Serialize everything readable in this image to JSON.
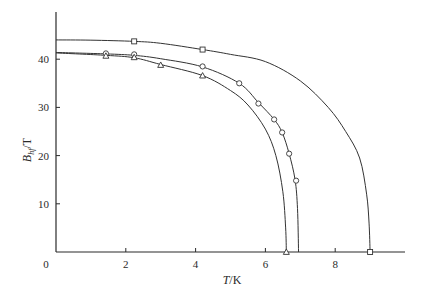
{
  "chart_data": {
    "type": "line",
    "title": "",
    "xlabel": "T/K",
    "ylabel": "B_hf/T",
    "ylabel_main": "B",
    "ylabel_sub": "hf",
    "ylabel_unit": "/T",
    "xlabel_main": "T",
    "xlabel_unit": "/K",
    "xlim": [
      0,
      10
    ],
    "ylim": [
      0,
      48
    ],
    "xticks": [
      0,
      2,
      4,
      6,
      8
    ],
    "xtick_labels": [
      "0",
      "2",
      "4",
      "6",
      "8"
    ],
    "yticks": [
      10,
      20,
      30,
      40
    ],
    "ytick_labels": [
      "10",
      "20",
      "30",
      "40"
    ],
    "grid": false,
    "legend": null,
    "series": [
      {
        "name": "square",
        "marker": "square",
        "curve": [
          [
            0,
            44.0
          ],
          [
            1,
            43.95
          ],
          [
            2.24,
            43.7
          ],
          [
            3,
            43.3
          ],
          [
            4.2,
            42.0
          ],
          [
            5,
            41.0
          ],
          [
            6,
            39.5
          ],
          [
            7,
            35.5
          ],
          [
            7.8,
            30.0
          ],
          [
            8.3,
            25.0
          ],
          [
            8.7,
            19.5
          ],
          [
            8.9,
            12.0
          ],
          [
            8.97,
            6.0
          ],
          [
            9.0,
            0
          ]
        ],
        "points": [
          [
            2.24,
            43.7
          ],
          [
            4.2,
            42.0
          ],
          [
            9.0,
            0
          ]
        ]
      },
      {
        "name": "circle",
        "marker": "circle",
        "curve": [
          [
            0,
            41.4
          ],
          [
            1.43,
            41.1
          ],
          [
            2.24,
            40.8
          ],
          [
            3,
            40.1
          ],
          [
            4.2,
            38.4
          ],
          [
            5.25,
            35.0
          ],
          [
            5.8,
            31.0
          ],
          [
            6.25,
            27.5
          ],
          [
            6.48,
            24.8
          ],
          [
            6.68,
            20.4
          ],
          [
            6.85,
            15.0
          ],
          [
            6.92,
            9.0
          ],
          [
            6.95,
            0
          ]
        ],
        "points": [
          [
            1.43,
            41.2
          ],
          [
            2.24,
            41.0
          ],
          [
            4.2,
            38.5
          ],
          [
            5.25,
            35.0
          ],
          [
            5.8,
            30.8
          ],
          [
            6.25,
            27.5
          ],
          [
            6.48,
            24.8
          ],
          [
            6.68,
            20.4
          ],
          [
            6.88,
            14.8
          ]
        ]
      },
      {
        "name": "triangle",
        "marker": "triangle",
        "curve": [
          [
            0,
            41.3
          ],
          [
            1.43,
            40.8
          ],
          [
            2.24,
            40.3
          ],
          [
            3,
            38.9
          ],
          [
            4.2,
            36.6
          ],
          [
            5,
            33.5
          ],
          [
            5.5,
            30.5
          ],
          [
            6,
            25.5
          ],
          [
            6.3,
            20.0
          ],
          [
            6.5,
            12.5
          ],
          [
            6.58,
            5.0
          ],
          [
            6.6,
            0
          ]
        ],
        "points": [
          [
            1.43,
            40.7
          ],
          [
            2.24,
            40.4
          ],
          [
            3.0,
            38.8
          ],
          [
            4.2,
            36.6
          ],
          [
            6.6,
            0
          ]
        ]
      }
    ]
  }
}
